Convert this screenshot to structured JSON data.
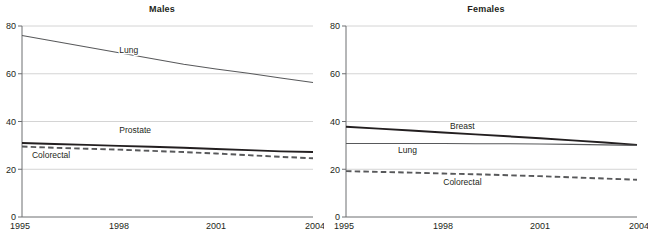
{
  "figure": {
    "width": 648,
    "height": 234,
    "background": "#ffffff",
    "grid_color": "#c9c9c9",
    "axis_color": "#6d6e71"
  },
  "chart_data": [
    {
      "type": "line",
      "title": "Males",
      "xlabel": "",
      "ylabel": "",
      "x": [
        1995,
        1996,
        1997,
        1998,
        1999,
        2000,
        2001,
        2002,
        2003,
        2004
      ],
      "xlim": [
        1995,
        2004
      ],
      "ylim": [
        0,
        80
      ],
      "xticks": [
        "1995",
        "1998",
        "2001",
        "2004"
      ],
      "yticks": [
        "0",
        "20",
        "40",
        "60",
        "80"
      ],
      "grid": true,
      "legend": "inline-labels",
      "series": [
        {
          "name": "Lung",
          "style": "thin-solid",
          "color": "#58595b",
          "label_x": 1998.3,
          "label_y": 68.5,
          "values": [
            76.0,
            73.6,
            71.2,
            68.8,
            66.4,
            64.0,
            62.0,
            60.2,
            58.2,
            56.3
          ]
        },
        {
          "name": "Prostate",
          "style": "thick-solid",
          "color": "#231f20",
          "label_x": 1998.5,
          "label_y": 35.0,
          "values": [
            31.0,
            30.6,
            30.2,
            29.8,
            29.4,
            29.0,
            28.5,
            28.0,
            27.5,
            27.2
          ]
        },
        {
          "name": "Colorectal",
          "style": "thick-dashed",
          "color": "#58595b",
          "label_x": 1995.9,
          "label_y": 24.6,
          "values": [
            29.5,
            29.0,
            28.6,
            28.2,
            27.7,
            27.2,
            26.6,
            25.9,
            25.2,
            24.6
          ]
        }
      ]
    },
    {
      "type": "line",
      "title": "Females",
      "xlabel": "",
      "ylabel": "",
      "x": [
        1995,
        1996,
        1997,
        1998,
        1999,
        2000,
        2001,
        2002,
        2003,
        2004
      ],
      "xlim": [
        1995,
        2004
      ],
      "ylim": [
        0,
        80
      ],
      "xticks": [
        "1995",
        "1998",
        "2001",
        "2004"
      ],
      "yticks": [
        "0",
        "20",
        "40",
        "60",
        "80"
      ],
      "grid": true,
      "legend": "inline-labels",
      "series": [
        {
          "name": "Breast",
          "style": "thick-solid",
          "color": "#231f20",
          "label_x": 1998.6,
          "label_y": 37.0,
          "values": [
            37.8,
            37.0,
            36.2,
            35.4,
            34.6,
            33.8,
            33.0,
            32.1,
            31.2,
            30.2
          ]
        },
        {
          "name": "Lung",
          "style": "thin-solid",
          "color": "#58595b",
          "label_x": 1996.9,
          "label_y": 27.0,
          "values": [
            30.8,
            30.8,
            30.8,
            30.8,
            30.7,
            30.7,
            30.6,
            30.4,
            30.2,
            30.0
          ]
        },
        {
          "name": "Colorectal",
          "style": "thick-dashed",
          "color": "#58595b",
          "label_x": 1998.6,
          "label_y": 13.2,
          "values": [
            19.2,
            18.9,
            18.6,
            18.2,
            17.9,
            17.5,
            17.1,
            16.6,
            16.1,
            15.6
          ]
        }
      ]
    }
  ]
}
